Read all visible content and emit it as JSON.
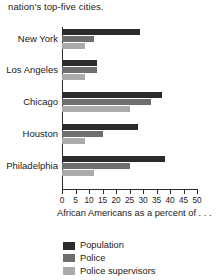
{
  "caption_top": "nation's top-five cities.",
  "caption_bottom": "African Americans as a percent of . . .",
  "colors": {
    "population": "#2b2b2b",
    "police": "#6e6e6e",
    "police_supervisors": "#aaaaaa",
    "axis": "#2b2b2b",
    "text": "#1a1a1a",
    "background": "#ffffff"
  },
  "legend": {
    "items": [
      {
        "label": "Population",
        "color": "#2b2b2b",
        "swatch": "legend-swatch-population"
      },
      {
        "label": "Police",
        "color": "#6e6e6e",
        "swatch": "legend-swatch-police"
      },
      {
        "label": "Police supervisors",
        "color": "#aaaaaa",
        "swatch": "legend-swatch-police-supervisors"
      }
    ]
  },
  "axis": {
    "ticks": [
      "0",
      "5",
      "10",
      "15",
      "20",
      "25",
      "30",
      "35",
      "40",
      "45",
      "50"
    ],
    "min": 0,
    "max": 50,
    "step": 5
  },
  "cities": [
    "New York",
    "Los Angeles",
    "Chicago",
    "Houston",
    "Philadelphia"
  ],
  "chart_data": {
    "type": "bar",
    "orientation": "horizontal",
    "title": "",
    "subtitle": "nation's top-five cities.",
    "xlabel": "African Americans as a percent of . . .",
    "ylabel": "",
    "xlim": [
      0,
      50
    ],
    "xticks": [
      0,
      5,
      10,
      15,
      20,
      25,
      30,
      35,
      40,
      45,
      50
    ],
    "grid": false,
    "legend_position": "bottom-left",
    "categories": [
      "New York",
      "Los Angeles",
      "Chicago",
      "Houston",
      "Philadelphia"
    ],
    "series": [
      {
        "name": "Population",
        "color": "#2b2b2b",
        "values": [
          29,
          13,
          37,
          28,
          38
        ]
      },
      {
        "name": "Police",
        "color": "#6e6e6e",
        "values": [
          12,
          13,
          33,
          15,
          25
        ]
      },
      {
        "name": "Police supervisors",
        "color": "#aaaaaa",
        "values": [
          8.5,
          8.5,
          25,
          8.5,
          12
        ]
      }
    ]
  }
}
